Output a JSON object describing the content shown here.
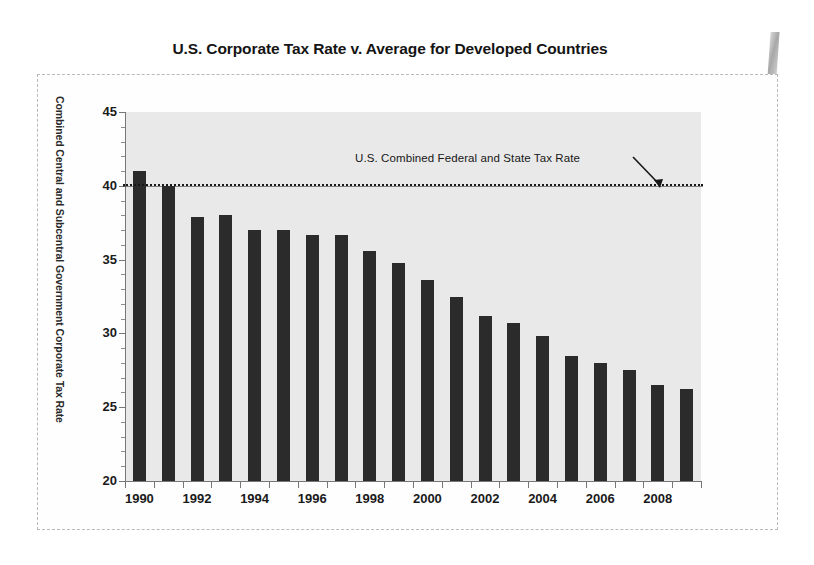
{
  "chart_data": {
    "type": "bar",
    "title": "U.S. Corporate Tax Rate v. Average for Developed Countries",
    "xlabel": "",
    "ylabel": "Combined Central and Subcentral Government Corporate Tax Rate",
    "ylim": [
      20,
      45
    ],
    "ytick_labels": [
      "20",
      "25",
      "30",
      "35",
      "40",
      "45"
    ],
    "ytick_values": [
      20,
      25,
      30,
      35,
      40,
      45
    ],
    "xtick_labels": [
      "1990",
      "1992",
      "1994",
      "1996",
      "1998",
      "2000",
      "2002",
      "2004",
      "2006",
      "2008"
    ],
    "xtick_values": [
      1990,
      1992,
      1994,
      1996,
      1998,
      2000,
      2002,
      2004,
      2006,
      2008
    ],
    "categories": [
      "1990",
      "1991",
      "1992",
      "1993",
      "1994",
      "1995",
      "1996",
      "1997",
      "1998",
      "1999",
      "2000",
      "2001",
      "2002",
      "2003",
      "2004",
      "2005",
      "2006",
      "2007",
      "2008",
      "2009"
    ],
    "values": [
      41.0,
      40.0,
      37.9,
      38.0,
      37.0,
      37.0,
      36.7,
      36.7,
      35.6,
      34.8,
      33.6,
      32.5,
      31.2,
      30.7,
      29.8,
      28.5,
      28.0,
      27.5,
      26.5,
      26.2
    ],
    "series": [
      {
        "name": "Average for Developed Countries",
        "values": [
          41.0,
          40.0,
          37.9,
          38.0,
          37.0,
          37.0,
          36.7,
          36.7,
          35.6,
          34.8,
          33.6,
          32.5,
          31.2,
          30.7,
          29.8,
          28.5,
          28.0,
          27.5,
          26.5,
          26.2
        ]
      },
      {
        "name": "U.S. Combined Federal and State Tax Rate",
        "type": "hline",
        "value": 40.1
      }
    ],
    "grid": false,
    "legend": "none",
    "annotations": [
      {
        "text": "U.S. Combined Federal and State Tax Rate",
        "points_to_value": 40.1,
        "arrow": "down-right"
      }
    ],
    "colors": {
      "bar": "#2b2b2b",
      "plot_background": "#e9e9e9",
      "line": "#181818",
      "axis": "#767676",
      "text": "#1a1a1a"
    }
  },
  "chart": {
    "title": "U.S. Corporate Tax Rate v. Average for Developed Countries",
    "y_axis_title": "Combined Central and Subcentral Government Corporate Tax Rate",
    "annotation_text": "U.S. Combined Federal and State Tax Rate"
  }
}
